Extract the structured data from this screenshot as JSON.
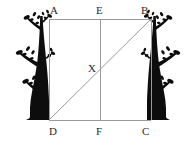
{
  "figure": {
    "background_color": "#ffffff",
    "line_color": "#9a9a9a",
    "tree_color": "#0d0d0d",
    "label_color": "#2b2b2b"
  },
  "labels": {
    "a": "A",
    "e": "E",
    "b": "B",
    "x": "X",
    "d": "D",
    "f": "F",
    "c": "C"
  },
  "geometry": {
    "rect_left": 49,
    "rect_right": 151,
    "rect_top": 19,
    "rect_bottom": 120,
    "midline_x": 100,
    "intersection_x": 100,
    "intersection_y": 69
  },
  "trees": {
    "left_label": "left-tree-silhouette",
    "right_label": "right-tree-silhouette"
  }
}
